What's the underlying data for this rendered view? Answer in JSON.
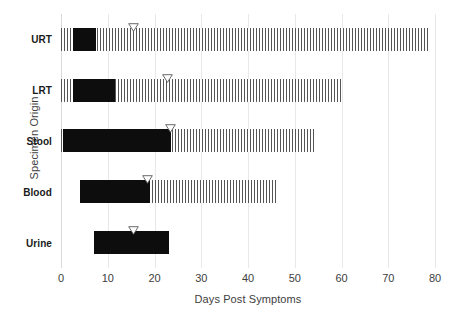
{
  "chart_data": {
    "type": "bar",
    "title": "",
    "xlabel": "Days Post Symptoms",
    "ylabel": "Specimen Origin",
    "xlim": [
      0,
      80
    ],
    "xticks": [
      0,
      10,
      20,
      30,
      40,
      50,
      60,
      70,
      80
    ],
    "grid": true,
    "legend": "none",
    "categories": [
      "URT",
      "LRT",
      "Stool",
      "Blood",
      "Urine"
    ],
    "series": [
      {
        "name": "Detectable range (hatched)",
        "style": "hatched",
        "starts": [
          0,
          0,
          0,
          4,
          7
        ],
        "ends": [
          78.5,
          60,
          54.5,
          46,
          23
        ]
      },
      {
        "name": "Peak / solid interval",
        "style": "solid",
        "starts": [
          2.5,
          2.5,
          0.5,
          4,
          7
        ],
        "ends": [
          7.5,
          11.5,
          23.5,
          19,
          23
        ]
      },
      {
        "name": "Median marker",
        "style": "triangle-marker",
        "values": [
          15.5,
          22.7,
          23.5,
          18.5,
          15.5
        ]
      }
    ],
    "bars": [
      {
        "category": "URT",
        "hatch_start": 0,
        "hatch_end": 78.5,
        "solid_start": 2.5,
        "solid_end": 7.5,
        "marker": 15.5
      },
      {
        "category": "LRT",
        "hatch_start": 0,
        "hatch_end": 60,
        "solid_start": 2.5,
        "solid_end": 11.5,
        "marker": 22.7
      },
      {
        "category": "Stool",
        "hatch_start": 0,
        "hatch_end": 54.5,
        "solid_start": 0.5,
        "solid_end": 23.5,
        "marker": 23.5
      },
      {
        "category": "Blood",
        "hatch_start": 4,
        "hatch_end": 46,
        "solid_start": 4,
        "solid_end": 19,
        "marker": 18.5
      },
      {
        "category": "Urine",
        "hatch_start": 7,
        "hatch_end": 23,
        "solid_start": 7,
        "solid_end": 23,
        "marker": 15.5
      }
    ]
  },
  "colors": {
    "solid_bar": "#0d0d0d",
    "hatch_stroke": "#555555",
    "gridline": "#e8e8e8",
    "text": "#404040",
    "label_text": "#1a1a1a",
    "background": "#ffffff",
    "marker_stroke": "#595959",
    "marker_fill": "#ffffff"
  },
  "icons": {
    "marker": "triangle-down-marker"
  }
}
